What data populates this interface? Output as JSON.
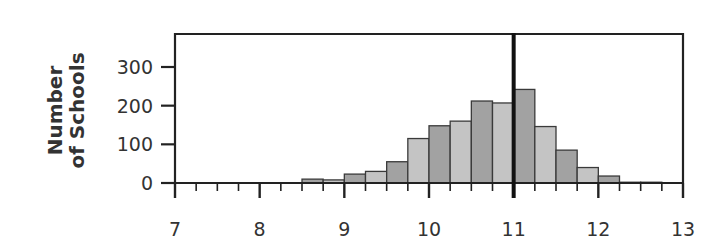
{
  "chart_data": {
    "type": "bar",
    "title": "",
    "xlabel": "",
    "ylabel": "Number of Schools",
    "ylabel_lines": [
      "Number",
      "of Schools"
    ],
    "xlim": [
      7,
      13
    ],
    "ylim": [
      0,
      380
    ],
    "xticks": [
      7,
      8,
      9,
      10,
      11,
      12,
      13
    ],
    "xtick_labels": [
      "7",
      "8",
      "9",
      "10",
      "11",
      "12",
      "13"
    ],
    "minor_xtick_step": 0.25,
    "yticks": [
      0,
      100,
      200,
      300
    ],
    "ytick_labels": [
      "0",
      "100",
      "200",
      "300"
    ],
    "grid": false,
    "bin_width": 0.25,
    "bins": [
      {
        "x0": 8.5,
        "x1": 8.75,
        "value": 10
      },
      {
        "x0": 8.75,
        "x1": 9.0,
        "value": 8
      },
      {
        "x0": 9.0,
        "x1": 9.25,
        "value": 23
      },
      {
        "x0": 9.25,
        "x1": 9.5,
        "value": 30
      },
      {
        "x0": 9.5,
        "x1": 9.75,
        "value": 55
      },
      {
        "x0": 9.75,
        "x1": 10.0,
        "value": 115
      },
      {
        "x0": 10.0,
        "x1": 10.25,
        "value": 148
      },
      {
        "x0": 10.25,
        "x1": 10.5,
        "value": 160
      },
      {
        "x0": 10.5,
        "x1": 10.75,
        "value": 212
      },
      {
        "x0": 10.75,
        "x1": 11.0,
        "value": 207
      },
      {
        "x0": 11.0,
        "x1": 11.25,
        "value": 242
      },
      {
        "x0": 11.25,
        "x1": 11.5,
        "value": 146
      },
      {
        "x0": 11.5,
        "x1": 11.75,
        "value": 85
      },
      {
        "x0": 11.75,
        "x1": 12.0,
        "value": 40
      },
      {
        "x0": 12.0,
        "x1": 12.25,
        "value": 18
      },
      {
        "x0": 12.25,
        "x1": 12.5,
        "value": 2
      },
      {
        "x0": 12.5,
        "x1": 12.75,
        "value": 2
      }
    ],
    "reference_line": {
      "x": 11,
      "color": "#111111"
    },
    "colors": {
      "bar_light": "#c4c4c4",
      "bar_dark": "#a2a2a2",
      "bar_edge": "#3a3a3a",
      "axis": "#222222"
    }
  }
}
